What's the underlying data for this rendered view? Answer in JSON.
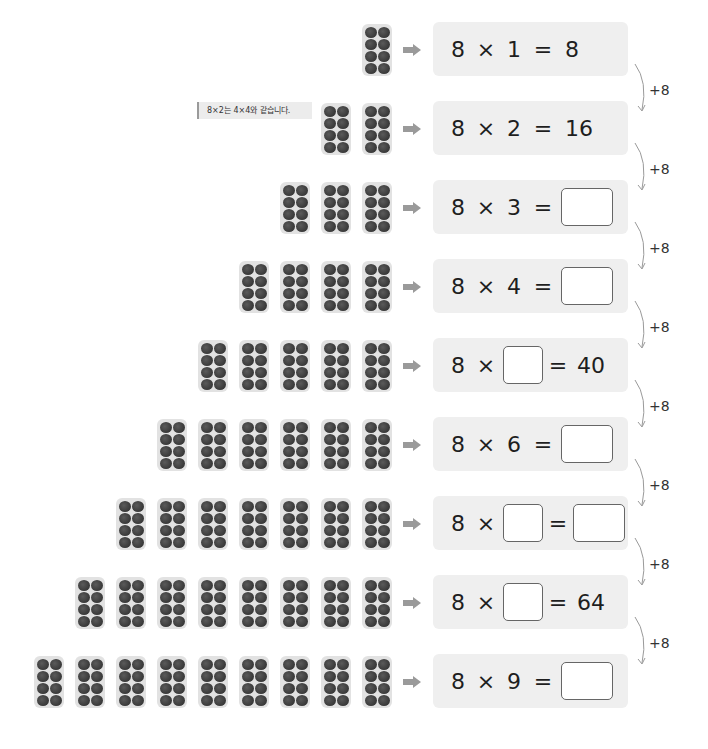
{
  "note": {
    "text": "8×2는 4×4와 같습니다."
  },
  "colors": {
    "pack_bg": "#e2e2e2",
    "egg": "#3d3d3d",
    "eq_bg": "#efefef",
    "arrow": "#9a9a9a",
    "blank_border": "#666666"
  },
  "icons": {
    "row_arrow": "right-arrow-icon",
    "connector": "curved-arrow-icon"
  },
  "rows": [
    {
      "packs": 1,
      "a": "8",
      "op": "×",
      "b": "1",
      "eq": "=",
      "result": "8",
      "b_blank": false,
      "result_blank": false
    },
    {
      "packs": 2,
      "a": "8",
      "op": "×",
      "b": "2",
      "eq": "=",
      "result": "16",
      "b_blank": false,
      "result_blank": false
    },
    {
      "packs": 3,
      "a": "8",
      "op": "×",
      "b": "3",
      "eq": "=",
      "result": "",
      "b_blank": false,
      "result_blank": true
    },
    {
      "packs": 4,
      "a": "8",
      "op": "×",
      "b": "4",
      "eq": "=",
      "result": "",
      "b_blank": false,
      "result_blank": true
    },
    {
      "packs": 5,
      "a": "8",
      "op": "×",
      "b": "",
      "eq": "=",
      "result": "40",
      "b_blank": true,
      "result_blank": false
    },
    {
      "packs": 6,
      "a": "8",
      "op": "×",
      "b": "6",
      "eq": "=",
      "result": "",
      "b_blank": false,
      "result_blank": true
    },
    {
      "packs": 7,
      "a": "8",
      "op": "×",
      "b": "",
      "eq": "=",
      "result": "",
      "b_blank": true,
      "result_blank": true
    },
    {
      "packs": 8,
      "a": "8",
      "op": "×",
      "b": "",
      "eq": "=",
      "result": "64",
      "b_blank": true,
      "result_blank": false
    },
    {
      "packs": 9,
      "a": "8",
      "op": "×",
      "b": "9",
      "eq": "=",
      "result": "",
      "b_blank": false,
      "result_blank": true
    }
  ],
  "connectors": [
    "+8",
    "+8",
    "+8",
    "+8",
    "+8",
    "+8",
    "+8",
    "+8"
  ]
}
